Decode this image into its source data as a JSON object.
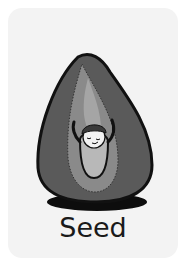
{
  "card": {
    "label": "Seed",
    "illustration": "seed-with-sprout-character-icon",
    "colors": {
      "card_bg": "#f3f3f3",
      "seed_outer": "#5a5a5a",
      "seed_inner": "#8a8a8a",
      "embryo": "#b5b5b5",
      "outline": "#111111",
      "shadow": "#0d0d0d"
    }
  }
}
